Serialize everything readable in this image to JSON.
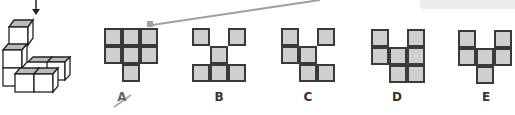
{
  "tooltip": {
    "text": ""
  },
  "question": {
    "arrow": "down-arrow",
    "figure": "3d-cube-stack"
  },
  "colors": {
    "cell_fill": "#cfcfcf",
    "cell_border": "#3a3a3a",
    "annotation_line": "#a0a0a0"
  },
  "options": [
    {
      "label": "A",
      "crossed_out": true,
      "cells": [
        [
          0,
          0
        ],
        [
          0,
          1
        ],
        [
          0,
          2
        ],
        [
          1,
          0
        ],
        [
          1,
          1
        ],
        [
          1,
          2
        ],
        [
          2,
          1
        ]
      ]
    },
    {
      "label": "B",
      "crossed_out": false,
      "cells": [
        [
          0,
          0
        ],
        [
          0,
          2
        ],
        [
          1,
          1
        ],
        [
          2,
          0
        ],
        [
          2,
          1
        ],
        [
          2,
          2
        ]
      ]
    },
    {
      "label": "C",
      "crossed_out": false,
      "cells": [
        [
          0,
          0
        ],
        [
          0,
          2
        ],
        [
          1,
          0
        ],
        [
          1,
          1
        ],
        [
          2,
          1
        ],
        [
          2,
          2
        ]
      ]
    },
    {
      "label": "D",
      "crossed_out": false,
      "cells": [
        [
          0,
          0
        ],
        [
          0,
          2
        ],
        [
          1,
          0
        ],
        [
          1,
          1
        ],
        [
          1,
          2
        ],
        [
          2,
          1
        ],
        [
          2,
          2
        ]
      ]
    },
    {
      "label": "E",
      "crossed_out": false,
      "cells": [
        [
          0,
          0
        ],
        [
          0,
          2
        ],
        [
          1,
          0
        ],
        [
          1,
          1
        ],
        [
          1,
          2
        ],
        [
          2,
          1
        ]
      ]
    }
  ]
}
